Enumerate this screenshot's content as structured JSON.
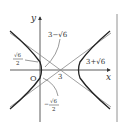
{
  "diagram": {
    "type": "hyperbola-graph",
    "axes": {
      "x_label": "x",
      "y_label": "y",
      "origin_label": "O"
    },
    "center_label": "3",
    "annotations": {
      "top": "3−√6",
      "right": "3+√6",
      "left_num": "√6",
      "left_den": "2",
      "bottom_sign": "−",
      "bottom_num": "√6",
      "bottom_den": "2"
    },
    "colors": {
      "curve": "#222222",
      "asymptote": "#888888",
      "axis": "#333333"
    }
  }
}
